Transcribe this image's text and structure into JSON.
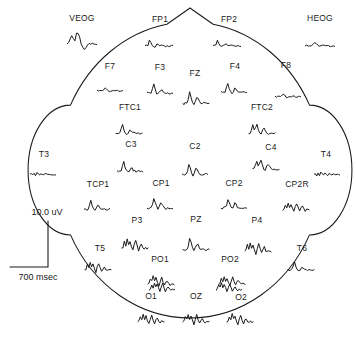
{
  "figure": {
    "type": "eeg-electrode-montage",
    "stroke_color": "#1a1a1a",
    "background_color": "#ffffff",
    "width": 356,
    "height": 342
  },
  "scale": {
    "amplitude_label": "10.0 uV",
    "time_label": "700 msec"
  },
  "head": {
    "cx": 190,
    "cy": 170,
    "rx": 133,
    "ry": 148,
    "nose": true,
    "ears": true
  },
  "sites": [
    {
      "label": "VEOG",
      "lx": 82,
      "ly": 18,
      "wx": 82,
      "wy": 41,
      "w": 30,
      "h": 22,
      "amp": 1.35,
      "shape": "veog",
      "inside": false
    },
    {
      "label": "HEOG",
      "lx": 320,
      "ly": 18,
      "wx": 320,
      "wy": 44,
      "w": 30,
      "h": 16,
      "amp": 0.55,
      "shape": "flat",
      "inside": false
    },
    {
      "label": "FP1",
      "lx": 160,
      "ly": 19,
      "wx": 159,
      "wy": 44,
      "w": 28,
      "h": 17,
      "amp": 0.7,
      "shape": "fp",
      "inside": true
    },
    {
      "label": "FP2",
      "lx": 229,
      "ly": 19,
      "wx": 227,
      "wy": 44,
      "w": 28,
      "h": 15,
      "amp": 0.6,
      "shape": "fp",
      "inside": true
    },
    {
      "label": "F7",
      "lx": 110,
      "ly": 66,
      "wx": 110,
      "wy": 89,
      "w": 26,
      "h": 14,
      "amp": 0.55,
      "shape": "flat",
      "inside": true
    },
    {
      "label": "F3",
      "lx": 160,
      "ly": 67,
      "wx": 160,
      "wy": 91,
      "w": 26,
      "h": 18,
      "amp": 0.85,
      "shape": "mid",
      "inside": true
    },
    {
      "label": "FZ",
      "lx": 195,
      "ly": 73,
      "wx": 196,
      "wy": 101,
      "w": 27,
      "h": 22,
      "amp": 1.1,
      "shape": "big",
      "inside": true
    },
    {
      "label": "F4",
      "lx": 235,
      "ly": 66,
      "wx": 234,
      "wy": 90,
      "w": 26,
      "h": 18,
      "amp": 0.85,
      "shape": "mid",
      "inside": true
    },
    {
      "label": "F8",
      "lx": 286,
      "ly": 65,
      "wx": 288,
      "wy": 95,
      "w": 26,
      "h": 14,
      "amp": 0.55,
      "shape": "flat",
      "inside": true
    },
    {
      "label": "FTC1",
      "lx": 130,
      "ly": 107,
      "wx": 129,
      "wy": 131,
      "w": 27,
      "h": 18,
      "amp": 0.8,
      "shape": "mid",
      "inside": true
    },
    {
      "label": "FTC2",
      "lx": 262,
      "ly": 107,
      "wx": 262,
      "wy": 131,
      "w": 27,
      "h": 19,
      "amp": 0.9,
      "shape": "notch",
      "inside": true
    },
    {
      "label": "T3",
      "lx": 44,
      "ly": 154,
      "wx": 43,
      "wy": 173,
      "w": 26,
      "h": 13,
      "amp": 0.5,
      "shape": "ripple",
      "inside": true
    },
    {
      "label": "C3",
      "lx": 131,
      "ly": 144,
      "wx": 130,
      "wy": 169,
      "w": 26,
      "h": 19,
      "amp": 0.9,
      "shape": "mid",
      "inside": true
    },
    {
      "label": "C2",
      "lx": 195,
      "ly": 146,
      "wx": 195,
      "wy": 172,
      "w": 26,
      "h": 21,
      "amp": 1.0,
      "shape": "big",
      "inside": true
    },
    {
      "label": "C4",
      "lx": 271,
      "ly": 147,
      "wx": 266,
      "wy": 167,
      "w": 27,
      "h": 19,
      "amp": 0.9,
      "shape": "notch",
      "inside": true
    },
    {
      "label": "T4",
      "lx": 326,
      "ly": 154,
      "wx": 327,
      "wy": 173,
      "w": 26,
      "h": 13,
      "amp": 0.5,
      "shape": "ripple",
      "inside": true
    },
    {
      "label": "TCP1",
      "lx": 98,
      "ly": 184,
      "wx": 97,
      "wy": 207,
      "w": 26,
      "h": 17,
      "amp": 0.75,
      "shape": "mid",
      "inside": true
    },
    {
      "label": "CP1",
      "lx": 161,
      "ly": 183,
      "wx": 160,
      "wy": 206,
      "w": 26,
      "h": 20,
      "amp": 0.95,
      "shape": "big",
      "inside": true
    },
    {
      "label": "CP2",
      "lx": 234,
      "ly": 183,
      "wx": 234,
      "wy": 206,
      "w": 26,
      "h": 19,
      "amp": 0.9,
      "shape": "big",
      "inside": true
    },
    {
      "label": "CP2R",
      "lx": 297,
      "ly": 184,
      "wx": 296,
      "wy": 208,
      "w": 27,
      "h": 17,
      "amp": 0.8,
      "shape": "burst",
      "inside": true
    },
    {
      "label": "P3",
      "lx": 137,
      "ly": 220,
      "wx": 135,
      "wy": 246,
      "w": 27,
      "h": 20,
      "amp": 0.95,
      "shape": "burst",
      "inside": true
    },
    {
      "label": "PZ",
      "lx": 196,
      "ly": 219,
      "wx": 196,
      "wy": 247,
      "w": 27,
      "h": 22,
      "amp": 1.05,
      "shape": "big",
      "inside": true
    },
    {
      "label": "P4",
      "lx": 257,
      "ly": 220,
      "wx": 258,
      "wy": 249,
      "w": 27,
      "h": 21,
      "amp": 1.0,
      "shape": "burst",
      "inside": true
    },
    {
      "label": "T5",
      "lx": 100,
      "ly": 248,
      "wx": 98,
      "wy": 268,
      "w": 27,
      "h": 17,
      "amp": 0.75,
      "shape": "burst",
      "inside": true
    },
    {
      "label": "PO1",
      "lx": 160,
      "ly": 259,
      "wx": 161,
      "wy": 282,
      "w": 27,
      "h": 17,
      "amp": 0.8,
      "shape": "burst",
      "inside": true
    },
    {
      "label": "PO2",
      "lx": 230,
      "ly": 259,
      "wx": 232,
      "wy": 282,
      "w": 27,
      "h": 17,
      "amp": 0.8,
      "shape": "burst",
      "inside": true
    },
    {
      "label": "T6",
      "lx": 302,
      "ly": 248,
      "wx": 301,
      "wy": 268,
      "w": 27,
      "h": 16,
      "amp": 0.7,
      "shape": "mid",
      "inside": true
    },
    {
      "label": "O1",
      "lx": 151,
      "ly": 296,
      "wx": 151,
      "wy": 320,
      "w": 27,
      "h": 18,
      "amp": 0.85,
      "shape": "burst",
      "inside": true
    },
    {
      "label": "OZ",
      "lx": 196,
      "ly": 296,
      "wx": 196,
      "wy": 320,
      "w": 27,
      "h": 18,
      "amp": 0.85,
      "shape": "burst",
      "inside": true
    },
    {
      "label": "O2",
      "lx": 241,
      "ly": 297,
      "wx": 240,
      "wy": 320,
      "w": 27,
      "h": 18,
      "amp": 0.85,
      "shape": "burst",
      "inside": true
    }
  ],
  "rim_waves": [
    {
      "label": "O1rim",
      "wx": 162,
      "wy": 288,
      "w": 26,
      "h": 16,
      "amp": 0.75,
      "shape": "burst"
    },
    {
      "label": "O2rim",
      "wx": 229,
      "wy": 288,
      "w": 26,
      "h": 16,
      "amp": 0.75,
      "shape": "burst"
    }
  ]
}
